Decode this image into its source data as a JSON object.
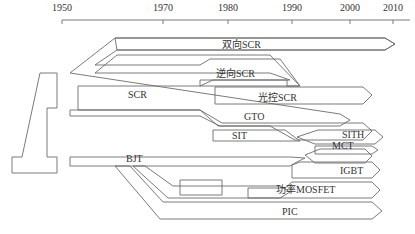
{
  "axis": {
    "ticks": [
      {
        "label": "1950",
        "x": 62
      },
      {
        "label": "1970",
        "x": 163
      },
      {
        "label": "1980",
        "x": 228
      },
      {
        "label": "1990",
        "x": 292
      },
      {
        "label": "2000",
        "x": 350
      },
      {
        "label": "2010",
        "x": 393
      }
    ]
  },
  "devices": {
    "bidirectional_scr": "双向SCR",
    "reverse_scr": "逆向SCR",
    "scr": "SCR",
    "light_scr": "光控SCR",
    "gto": "GTO",
    "sit": "SIT",
    "sith": "SITH",
    "mct": "MCT",
    "bjt": "BJT",
    "igbt": "IGBT",
    "power_mosfet": "功率MOSFET",
    "pic": "PIC"
  }
}
